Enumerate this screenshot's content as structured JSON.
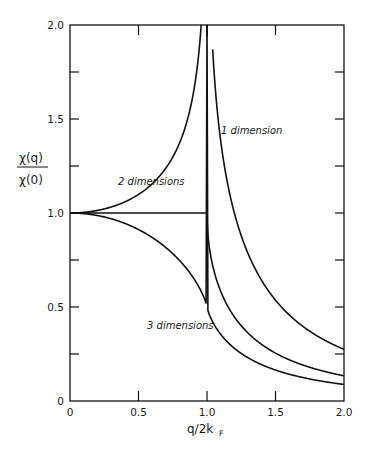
{
  "chart_data": {
    "type": "line",
    "title": "",
    "xlabel": "q/2k_F",
    "ylabel": "χ(q) / χ(0)",
    "ylabel_numerator": "χ(q)",
    "ylabel_denominator": "χ(0)",
    "xlabel_main": "q/2k",
    "xlabel_sub": "F",
    "xlim": [
      0,
      2.0
    ],
    "ylim": [
      0,
      2.0
    ],
    "grid": false,
    "legend": "inline curve labels",
    "x_ticks": [
      0,
      0.5,
      1.0,
      1.5,
      2.0
    ],
    "x_tick_labels": [
      "0",
      "0.5",
      "1.0",
      "1.5",
      "2.0"
    ],
    "y_ticks": [
      0,
      0.5,
      1.0,
      1.5,
      2.0
    ],
    "y_tick_labels": [
      "0",
      "0.5",
      "1.0",
      "1.5",
      "2.0"
    ],
    "y_minor_ticks": [
      0.25,
      0.75,
      1.25,
      1.75
    ],
    "x": [
      0,
      0.1,
      0.2,
      0.3,
      0.4,
      0.5,
      0.6,
      0.7,
      0.8,
      0.9,
      0.95,
      1.0,
      1.05,
      1.1,
      1.2,
      1.3,
      1.4,
      1.5,
      1.6,
      1.7,
      1.8,
      1.9,
      2.0
    ],
    "series": [
      {
        "name": "1 dimension",
        "values": [
          1.0,
          1.003,
          1.014,
          1.034,
          1.059,
          1.099,
          1.155,
          1.24,
          1.373,
          1.636,
          1.922,
          null,
          1.86,
          1.389,
          1.001,
          0.847,
          0.721,
          0.549,
          0.47,
          0.41,
          0.364,
          0.324,
          0.275
        ]
      },
      {
        "name": "2 dimensions",
        "values": [
          1.0,
          1.0,
          1.0,
          1.0,
          1.0,
          1.0,
          1.0,
          1.0,
          1.0,
          1.0,
          1.0,
          1.0,
          0.695,
          0.583,
          0.447,
          0.362,
          0.3,
          0.255,
          0.219,
          0.191,
          0.169,
          0.15,
          0.134
        ]
      },
      {
        "name": "3 dimensions",
        "values": [
          1.0,
          0.997,
          0.987,
          0.969,
          0.942,
          0.906,
          0.859,
          0.797,
          0.717,
          0.609,
          0.536,
          0.5,
          0.464,
          0.432,
          0.376,
          0.327,
          0.286,
          0.248,
          0.218,
          0.192,
          0.167,
          0.146,
          0.088
        ]
      }
    ],
    "annotations": [
      {
        "text": "1 dimension",
        "x": 1.35,
        "y": 1.3
      },
      {
        "text": "2 dimensions",
        "x": 0.65,
        "y": 1.03
      },
      {
        "text": "3 dimensions",
        "x": 0.6,
        "y": 0.5
      }
    ]
  },
  "labels": {
    "curve_1d": "1 dimension",
    "curve_2d": "2 dimensions",
    "curve_3d": "3 dimensions"
  },
  "colors": {
    "line": "#111111",
    "background": "#ffffff"
  }
}
